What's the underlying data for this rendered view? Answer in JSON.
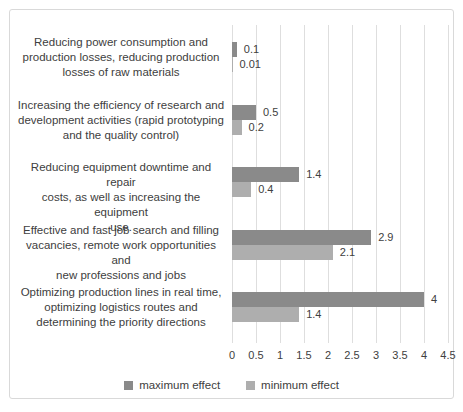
{
  "chart_data": {
    "type": "bar",
    "orientation": "horizontal",
    "title": "",
    "xlabel": "",
    "ylabel": "",
    "xlim": [
      0,
      4.5
    ],
    "grid": "vertical",
    "legend_position": "bottom",
    "categories": [
      "Reducing power consumption and production losses, reducing production losses of raw materials",
      "Increasing the efficiency of research and development activities (rapid prototyping and the quality control)",
      "Reducing equipment downtime and repair costs, as well as increasing the equipment use.",
      "Effective and fast job search and filling vacancies, remote work opportunities and new professions and jobs",
      "Optimizing production lines in real time, optimizing logistics routes and determining the priority directions"
    ],
    "category_lines": [
      [
        "Reducing power consumption and",
        "production losses, reducing production",
        "losses of raw materials"
      ],
      [
        "Increasing the efficiency of research and",
        "development activities (rapid prototyping",
        "and the quality control)"
      ],
      [
        "Reducing equipment downtime and repair",
        "costs, as well as increasing the equipment",
        "use."
      ],
      [
        "Effective and fast job search and filling",
        "vacancies, remote work opportunities and",
        "new professions and jobs"
      ],
      [
        "Optimizing production lines in real time,",
        "optimizing logistics routes and",
        "determining the priority directions"
      ]
    ],
    "series": [
      {
        "name": "maximum effect",
        "color": "#8a8a8a",
        "values": [
          0.1,
          0.5,
          1.4,
          2.9,
          4
        ],
        "labels": [
          "0.1",
          "0.5",
          "1.4",
          "2.9",
          "4"
        ]
      },
      {
        "name": "minimum effect",
        "color": "#aeaeae",
        "values": [
          0.01,
          0.2,
          0.4,
          2.1,
          1.4
        ],
        "labels": [
          "0.01",
          "0.2",
          "0.4",
          "2.1",
          "1.4"
        ]
      }
    ],
    "xticks": [
      "0",
      "0.5",
      "1",
      "1.5",
      "2",
      "2.5",
      "3",
      "3.5",
      "4",
      "4.5"
    ]
  },
  "layout_values": {
    "group_tops_px": [
      17,
      80,
      142,
      205,
      267
    ],
    "label_tops_px": [
      25,
      88,
      150,
      213,
      275
    ],
    "bar_height_px": 15,
    "plot_width_px": 216,
    "x_max": 4.5,
    "gridline_color": "#dedede",
    "text_color": "#404040",
    "frame_border_color": "#d9d9d9"
  }
}
